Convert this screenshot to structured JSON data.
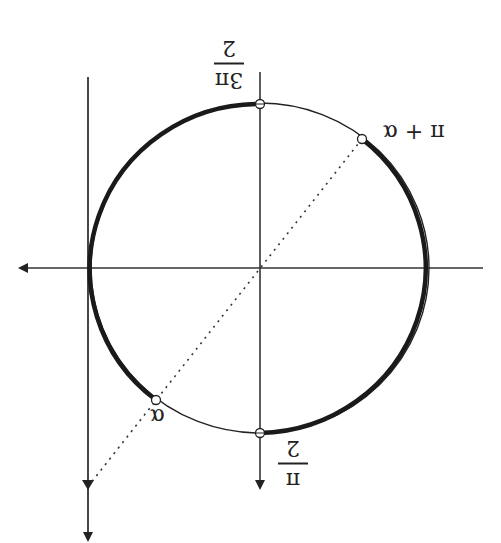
{
  "diagram": {
    "orientation": "rotated-180",
    "colors": {
      "stroke": "#222222",
      "background": "#ffffff"
    },
    "circle": {
      "cx": 260,
      "cy": 268,
      "rx": 169,
      "ry": 165
    },
    "labels": {
      "three_pi_over_2": {
        "num": "3π",
        "den": "2"
      },
      "pi_over_2": {
        "num": "π",
        "den": "2"
      },
      "alpha": "α",
      "pi_plus_alpha": "π + α"
    },
    "points": [
      {
        "name": "3π/2",
        "x": 260,
        "y": 104
      },
      {
        "name": "π/2",
        "x": 260,
        "y": 433
      },
      {
        "name": "α",
        "x": 156,
        "y": 400
      },
      {
        "name": "π + α",
        "x": 362,
        "y": 139
      }
    ]
  }
}
